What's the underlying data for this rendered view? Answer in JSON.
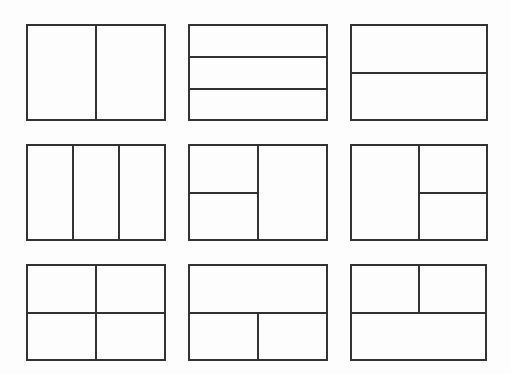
{
  "diagram": {
    "title": "",
    "stroke_color": "#333333",
    "background_color": "#fdfdfd",
    "layouts": [
      {
        "id": "layout-two-columns",
        "x": 26,
        "y": 24,
        "w": 140,
        "h": 97,
        "lines": [
          {
            "dir": "v",
            "x": 69,
            "y": 0,
            "len": 97
          }
        ]
      },
      {
        "id": "layout-three-rows",
        "x": 188,
        "y": 24,
        "w": 140,
        "h": 97,
        "lines": [
          {
            "dir": "h",
            "x": 0,
            "y": 32,
            "len": 140
          },
          {
            "dir": "h",
            "x": 0,
            "y": 64,
            "len": 140
          }
        ]
      },
      {
        "id": "layout-two-rows",
        "x": 350,
        "y": 24,
        "w": 138,
        "h": 97,
        "lines": [
          {
            "dir": "h",
            "x": 0,
            "y": 48,
            "len": 138
          }
        ]
      },
      {
        "id": "layout-three-columns",
        "x": 26,
        "y": 144,
        "w": 140,
        "h": 97,
        "lines": [
          {
            "dir": "v",
            "x": 46,
            "y": 0,
            "len": 97
          },
          {
            "dir": "v",
            "x": 92,
            "y": 0,
            "len": 97
          }
        ]
      },
      {
        "id": "layout-left-split-right-full",
        "x": 188,
        "y": 144,
        "w": 140,
        "h": 97,
        "lines": [
          {
            "dir": "v",
            "x": 69,
            "y": 0,
            "len": 97
          },
          {
            "dir": "h",
            "x": 0,
            "y": 48,
            "len": 70
          }
        ]
      },
      {
        "id": "layout-left-full-right-split",
        "x": 350,
        "y": 144,
        "w": 138,
        "h": 97,
        "lines": [
          {
            "dir": "v",
            "x": 68,
            "y": 0,
            "len": 97
          },
          {
            "dir": "h",
            "x": 68,
            "y": 48,
            "len": 70
          }
        ]
      },
      {
        "id": "layout-four-quadrants",
        "x": 26,
        "y": 264,
        "w": 140,
        "h": 97,
        "lines": [
          {
            "dir": "v",
            "x": 69,
            "y": 0,
            "len": 97
          },
          {
            "dir": "h",
            "x": 0,
            "y": 48,
            "len": 140
          }
        ]
      },
      {
        "id": "layout-top-full-bottom-split",
        "x": 188,
        "y": 264,
        "w": 140,
        "h": 97,
        "lines": [
          {
            "dir": "h",
            "x": 0,
            "y": 48,
            "len": 140
          },
          {
            "dir": "v",
            "x": 69,
            "y": 48,
            "len": 49
          }
        ]
      },
      {
        "id": "layout-top-split-bottom-full",
        "x": 350,
        "y": 264,
        "w": 137,
        "h": 97,
        "lines": [
          {
            "dir": "h",
            "x": 0,
            "y": 48,
            "len": 137
          },
          {
            "dir": "v",
            "x": 68,
            "y": 0,
            "len": 49
          }
        ]
      }
    ]
  }
}
